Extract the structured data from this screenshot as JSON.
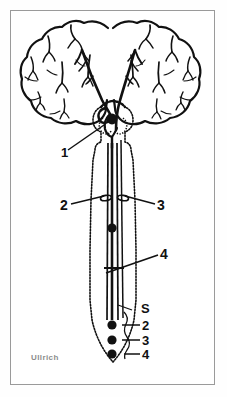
{
  "figure": {
    "signature": "Ullrich",
    "colors": {
      "ink": "#111111",
      "frame": "#9a9a9a",
      "signature": "#8c8c8c",
      "background": "#ffffff"
    }
  },
  "labels": {
    "callout_1": "1",
    "callout_2": "2",
    "callout_3": "3",
    "callout_4": "4",
    "segment_s": "S",
    "segment_2": "2",
    "segment_3": "3",
    "segment_4": "4"
  },
  "parts": {
    "left_hemisphere": "left-cerebral-hemisphere",
    "right_hemisphere": "right-cerebral-hemisphere",
    "brainstem": "brainstem",
    "spinal_cord": "spinal-cord",
    "decussation": "pyramidal-decussation",
    "cell_body_upper": "upper-motor-neuron-soma",
    "cell_body_mid": "mid-cord-neuron-soma",
    "motor_nuclei": [
      "motor-nucleus-2",
      "motor-nucleus-3",
      "motor-nucleus-4"
    ]
  }
}
